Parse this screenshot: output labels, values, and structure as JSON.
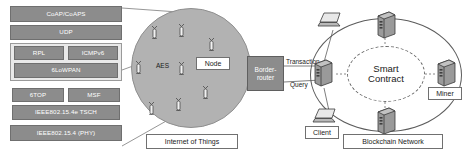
{
  "protocol_stack": {
    "name": "IoT protocol stack",
    "layers": [
      {
        "id": "coap",
        "label": "CoAP/CoAPS"
      },
      {
        "id": "udp",
        "label": "UDP"
      },
      {
        "id": "rpl",
        "label": "RPL"
      },
      {
        "id": "icmpv6",
        "label": "ICMPv6"
      },
      {
        "id": "6lowpan",
        "label": "6LoWPAN"
      },
      {
        "id": "6top",
        "label": "6TOP"
      },
      {
        "id": "msf",
        "label": "MSF"
      },
      {
        "id": "tsch",
        "label": "IEEE802.15.4e TSCH"
      },
      {
        "id": "phy",
        "label": "IEEE802.15.4 (PHY)"
      }
    ]
  },
  "iot": {
    "area_label": "Internet of Things",
    "aes_label": "AES",
    "node_label": "Node",
    "sensor_count": 8
  },
  "border_router": {
    "label_line1": "Border-",
    "label_line2": "router"
  },
  "flows": {
    "transaction": "Transaction",
    "query": "Query"
  },
  "blockchain": {
    "area_label": "Blockchain Network",
    "smart_contract_line1": "Smart",
    "smart_contract_line2": "Contract",
    "miner_label": "Miner",
    "client_label": "Client",
    "server_count": 4,
    "laptop_count": 2
  },
  "colors": {
    "stack_fill": "#8c8c8c",
    "stack_group_fill": "#e9e9e9",
    "iot_cloud_fill": "#b2b2b2",
    "border_router_fill": "#8c8c8c",
    "line": "#5d5d5d",
    "text_on_fill": "#ffffff",
    "text": "#1a1a1a"
  }
}
